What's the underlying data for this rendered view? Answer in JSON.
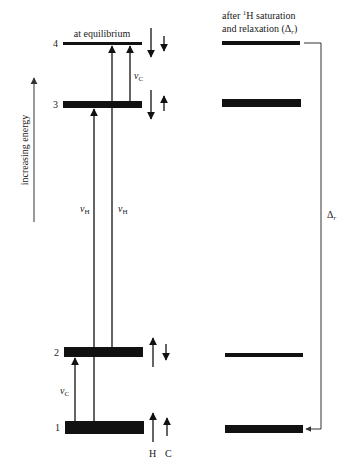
{
  "diagram": {
    "type": "energy-level-diagram",
    "axis_label": "increasing energy",
    "left_panel": {
      "title": "at equilibrium",
      "levels": [
        {
          "number": "1",
          "population": "largest",
          "spins": {
            "H": "up",
            "C": "up"
          }
        },
        {
          "number": "2",
          "population": "large",
          "spins": {
            "H": "up",
            "C": "down"
          }
        },
        {
          "number": "3",
          "population": "large",
          "spins": {
            "H": "down",
            "C": "up"
          }
        },
        {
          "number": "4",
          "population": "smallest",
          "spins": {
            "H": "down",
            "C": "down"
          }
        }
      ],
      "transitions": [
        {
          "from": "1",
          "to": "2",
          "label": "ν",
          "subscript": "C"
        },
        {
          "from": "1",
          "to": "3",
          "label": "ν",
          "subscript": "H"
        },
        {
          "from": "2",
          "to": "4",
          "label": "ν",
          "subscript": "H"
        },
        {
          "from": "3",
          "to": "4",
          "label": "ν",
          "subscript": "C"
        }
      ],
      "spin_column_labels": [
        "H",
        "C"
      ]
    },
    "right_panel": {
      "title_line1_prefix": "after ",
      "title_line1_sup": "1",
      "title_line1_suffix": "H saturation",
      "title_line2_prefix": "and relaxation (Δ",
      "title_line2_sub": "r",
      "title_line2_suffix": ")",
      "levels": [
        {
          "number": "1",
          "population": "largest"
        },
        {
          "number": "2",
          "population": "smaller"
        },
        {
          "number": "3",
          "population": "large"
        },
        {
          "number": "4",
          "population": "small"
        }
      ],
      "relaxation_label": "Δ",
      "relaxation_subscript": "r",
      "relaxation_from": "4",
      "relaxation_to": "1"
    }
  }
}
